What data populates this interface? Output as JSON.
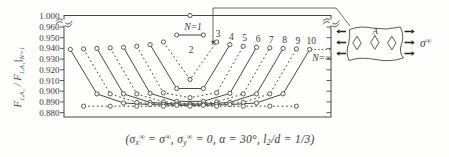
{
  "figure_type": "scanned-paper-figure",
  "chart_data": {
    "type": "line",
    "title": "",
    "xlabel": "",
    "ylabel": "F1,A1 / F1,A1 |N=1",
    "x_meaning": "hole position in the row (index i = 1..N), curves labelled by number of holes N",
    "ylim": [
      0.88,
      1.0
    ],
    "axis_break_between": [
      0.96,
      1.0
    ],
    "yticks": [
      "1.000",
      "0.960",
      "0.950",
      "0.940",
      "0.930",
      "0.920",
      "0.910",
      "0.900",
      "0.890",
      "0.880"
    ],
    "ytick_values": [
      1.0,
      0.96,
      0.95,
      0.94,
      0.93,
      0.92,
      0.91,
      0.9,
      0.89,
      0.88
    ],
    "grid": false,
    "legend_position": "labels-on-curves",
    "series": [
      {
        "label": "N=1",
        "style": "solid",
        "values": [
          1.0
        ]
      },
      {
        "label": "2",
        "style": "solid",
        "values": [
          0.9525,
          0.9525
        ]
      },
      {
        "label": "3",
        "style": "dashed",
        "values": [
          0.946,
          0.911,
          0.946
        ]
      },
      {
        "label": "4",
        "style": "solid",
        "values": [
          0.9435,
          0.9025,
          0.9025,
          0.9435
        ]
      },
      {
        "label": "5",
        "style": "dashed",
        "values": [
          0.942,
          0.8985,
          0.894,
          0.8985,
          0.942
        ]
      },
      {
        "label": "6",
        "style": "solid",
        "values": [
          0.941,
          0.898,
          0.8905,
          0.8905,
          0.898,
          0.941
        ]
      },
      {
        "label": "7",
        "style": "dashed",
        "values": [
          0.9405,
          0.8975,
          0.89,
          0.8885,
          0.89,
          0.8975,
          0.9405
        ]
      },
      {
        "label": "8",
        "style": "solid",
        "values": [
          0.94,
          0.8975,
          0.8895,
          0.888,
          0.888,
          0.8895,
          0.8975,
          0.94
        ]
      },
      {
        "label": "9",
        "style": "dashed",
        "values": [
          0.9395,
          0.8975,
          0.8895,
          0.8878,
          0.8872,
          0.8878,
          0.8895,
          0.8975,
          0.9395
        ]
      },
      {
        "label": "10",
        "style": "solid",
        "values": [
          0.939,
          0.8975,
          0.889,
          0.8875,
          0.8868,
          0.8868,
          0.8875,
          0.889,
          0.8975,
          0.939
        ]
      },
      {
        "label": "N=∞",
        "style": "dashed",
        "values": [
          0.886,
          0.886,
          0.886,
          0.886,
          0.886,
          0.886,
          0.886,
          0.886,
          0.886
        ],
        "extends_to_right_axis_at": 0.94
      }
    ]
  },
  "ylabel_parts": [
    {
      "t": "F"
    },
    {
      "t": "1,A₁",
      "pos": "sub"
    },
    {
      "t": " / "
    },
    {
      "t": "F"
    },
    {
      "t": "1,A₁",
      "pos": "sub"
    },
    {
      "t": "|"
    },
    {
      "t": "N=1",
      "pos": "sub"
    }
  ],
  "caption_parts": [
    {
      "t": "(σ"
    },
    {
      "t": "x",
      "pos": "sub"
    },
    {
      "t": "∞",
      "pos": "sup"
    },
    {
      "t": " = σ"
    },
    {
      "t": "∞",
      "pos": "sup"
    },
    {
      "t": ",  σ"
    },
    {
      "t": "y",
      "pos": "sub"
    },
    {
      "t": "∞",
      "pos": "sup"
    },
    {
      "t": " = 0,  α = 30°,  "
    },
    {
      "t": "l"
    },
    {
      "t": "2",
      "pos": "sub"
    },
    {
      "t": "/d = 1/3)"
    }
  ],
  "caption_text": "(σx∞ = σ∞,  σy∞ = 0,  α = 30°,  l2/d = 1/3)",
  "inset": {
    "hole_label": "A",
    "num_diamond_holes": 3,
    "sigma_label": {
      "base": "σ",
      "sup": "∞"
    },
    "meaning": "plate strip with a row of diamond (rhombic) holes under remote tension"
  },
  "colors": {
    "stroke": "#474747",
    "text": "#3c3c3c",
    "arrow": "#1e1e1e",
    "background": "#fdfdfc"
  }
}
